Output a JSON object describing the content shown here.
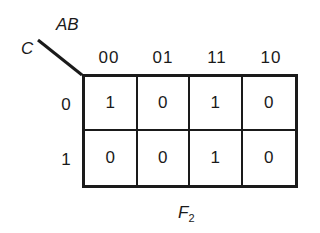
{
  "kmap": {
    "column_variable": "AB",
    "row_variable": "C",
    "column_headers": [
      "00",
      "01",
      "11",
      "10"
    ],
    "row_headers": [
      "0",
      "1"
    ],
    "cells": [
      [
        "1",
        "0",
        "1",
        "0"
      ],
      [
        "0",
        "0",
        "1",
        "0"
      ]
    ],
    "caption_main": "F",
    "caption_sub": "2"
  }
}
